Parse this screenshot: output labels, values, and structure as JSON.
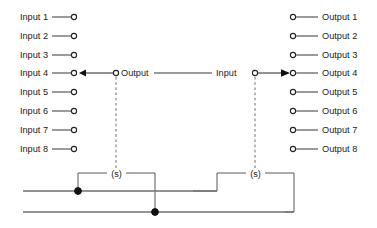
{
  "diagram": {
    "colors": {
      "wire": "#4a4a4a",
      "rail": "#6f6f6f",
      "terminal_stroke": "#222222",
      "junction": "#111111",
      "dashed": "#6a6a6a",
      "text": "#1b1b1b",
      "background": "#ffffff"
    },
    "inputs": {
      "labels": [
        "Input 1",
        "Input 2",
        "Input 3",
        "Input 4",
        "Input 5",
        "Input 6",
        "Input 7",
        "Input 8"
      ]
    },
    "outputs": {
      "labels": [
        "Output 1",
        "Output 2",
        "Output 3",
        "Output 4",
        "Output 5",
        "Output 6",
        "Output 7",
        "Output 8"
      ]
    },
    "center_labels": {
      "output": "Output",
      "input": "Input"
    },
    "switch_labels": {
      "left": "(s)",
      "right": "(s)"
    }
  }
}
